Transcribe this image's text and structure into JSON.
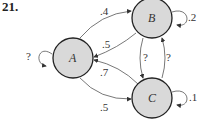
{
  "problem_number": "21.",
  "colors": {
    "node_fill": "#d9d9d9",
    "node_stroke": "#222222",
    "edge": "#555555"
  },
  "nodes": [
    {
      "id": "A",
      "label": "A"
    },
    {
      "id": "B",
      "label": "B"
    },
    {
      "id": "C",
      "label": "C"
    }
  ],
  "edges": [
    {
      "from": "A",
      "to": "B",
      "label": ".4"
    },
    {
      "from": "B",
      "to": "A",
      "label": ".5"
    },
    {
      "from": "C",
      "to": "A",
      "label": ".7"
    },
    {
      "from": "A",
      "to": "C",
      "label": ".5"
    },
    {
      "from": "A",
      "to": "A",
      "label": "?"
    },
    {
      "from": "B",
      "to": "B",
      "label": ".2"
    },
    {
      "from": "B",
      "to": "C",
      "label": "?"
    },
    {
      "from": "C",
      "to": "B",
      "label": "?"
    },
    {
      "from": "C",
      "to": "C",
      "label": ".1"
    }
  ]
}
